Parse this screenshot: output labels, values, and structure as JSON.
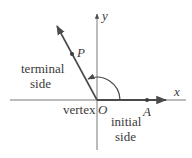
{
  "diagram": {
    "type": "angle-in-standard-position",
    "axes": {
      "x_label": "x",
      "y_label": "y"
    },
    "points": {
      "origin": "O",
      "initial_point": "A",
      "terminal_point": "P"
    },
    "labels": {
      "terminal_side_line1": "terminal",
      "terminal_side_line2": "side",
      "initial_side_line1": "initial",
      "initial_side_line2": "side",
      "vertex": "vertex"
    },
    "colors": {
      "line": "#4a4a4a",
      "text": "#3a3a3a",
      "background": "#ffffff"
    }
  }
}
